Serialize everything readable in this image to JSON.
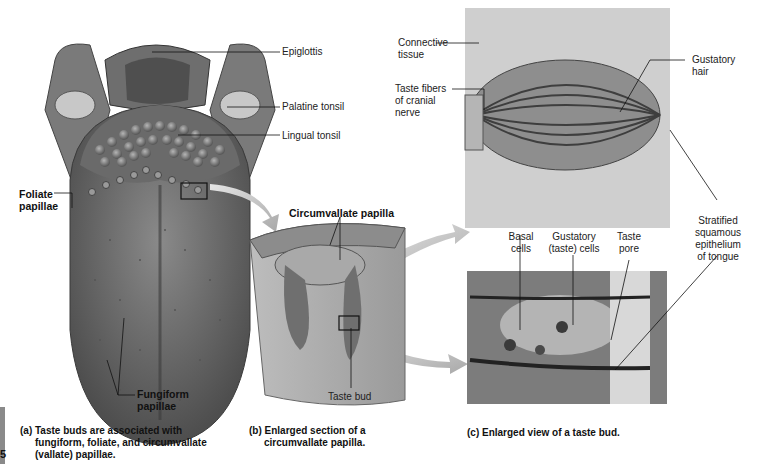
{
  "figure": {
    "panel_a": {
      "labels": {
        "epiglottis": "Epiglottis",
        "palatine_tonsil": "Palatine tonsil",
        "lingual_tonsil": "Lingual tonsil",
        "foliate_papillae": [
          "Foliate",
          "papillae"
        ],
        "fungiform_papillae": [
          "Fungiform",
          "papillae"
        ]
      },
      "caption": [
        "(a) Taste buds are associated with",
        "fungiform, foliate, and circumvallate",
        "(vallate) papillae."
      ]
    },
    "panel_b": {
      "labels": {
        "circumvallate_papilla": "Circumvallate papilla",
        "taste_bud": "Taste bud"
      },
      "caption": [
        "(b) Enlarged section of a",
        "circumvallate papilla."
      ]
    },
    "panel_c": {
      "labels": {
        "connective_tissue": [
          "Connective",
          "tissue"
        ],
        "taste_fibers": [
          "Taste fibers",
          "of cranial",
          "nerve"
        ],
        "gustatory_hair": [
          "Gustatory",
          "hair"
        ],
        "basal_cells": [
          "Basal",
          "cells"
        ],
        "gustatory_cells": [
          "Gustatory",
          "(taste) cells"
        ],
        "taste_pore": [
          "Taste",
          "pore"
        ],
        "stratified_epithelium": [
          "Stratified",
          "squamous",
          "epithelium",
          "of tongue"
        ]
      },
      "caption": [
        "(c) Enlarged view of a taste bud."
      ]
    },
    "page_number_fragment": "5"
  }
}
